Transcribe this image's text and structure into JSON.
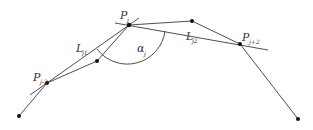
{
  "diagram": {
    "colors": {
      "line": "#3a3a3a",
      "point": "#111111",
      "text": "#333333",
      "background": "#ffffff"
    },
    "points": [
      {
        "id": "p0",
        "x": 19,
        "y": 116
      },
      {
        "id": "Pj-2",
        "x": 47,
        "y": 83
      },
      {
        "id": "p2",
        "x": 97,
        "y": 61
      },
      {
        "id": "Pj",
        "x": 129,
        "y": 25
      },
      {
        "id": "p4",
        "x": 192,
        "y": 21
      },
      {
        "id": "Pj+2",
        "x": 240,
        "y": 44
      },
      {
        "id": "p6",
        "x": 298,
        "y": 119
      }
    ],
    "labels": {
      "pj_main": "P",
      "pj_sub": "j",
      "pjm2_main": "P",
      "pjm2_sub": "j-2",
      "pjp2_main": "P",
      "pjp2_sub": "j+2",
      "lj1_main": "L",
      "lj1_sub": "j1",
      "lj2_main": "L",
      "lj2_sub": "j2",
      "alpha_main": "α",
      "alpha_sub": "j"
    }
  }
}
